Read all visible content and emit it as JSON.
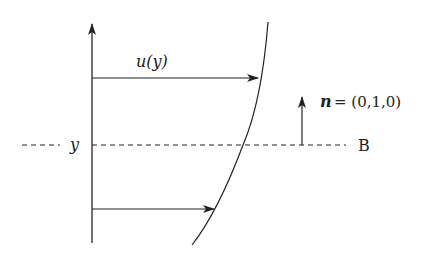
{
  "diagram": {
    "labels": {
      "velocity": "u(y)",
      "y_axis_marker": "y",
      "normal_vector": "n",
      "normal_equals": "= (0,1,0)",
      "boundary": "B"
    },
    "elements": [
      {
        "type": "axis",
        "name": "y-axis",
        "direction": "up"
      },
      {
        "type": "arrow",
        "name": "velocity-arrow-top",
        "label": "u(y)"
      },
      {
        "type": "arrow",
        "name": "velocity-arrow-bottom"
      },
      {
        "type": "curve",
        "name": "velocity-profile-curve"
      },
      {
        "type": "dashed-line",
        "name": "boundary-line",
        "label": "B"
      },
      {
        "type": "arrow",
        "name": "normal-vector-arrow",
        "label": "n = (0,1,0)"
      }
    ],
    "colors": {
      "stroke": "#222222",
      "background": "#ffffff"
    }
  }
}
